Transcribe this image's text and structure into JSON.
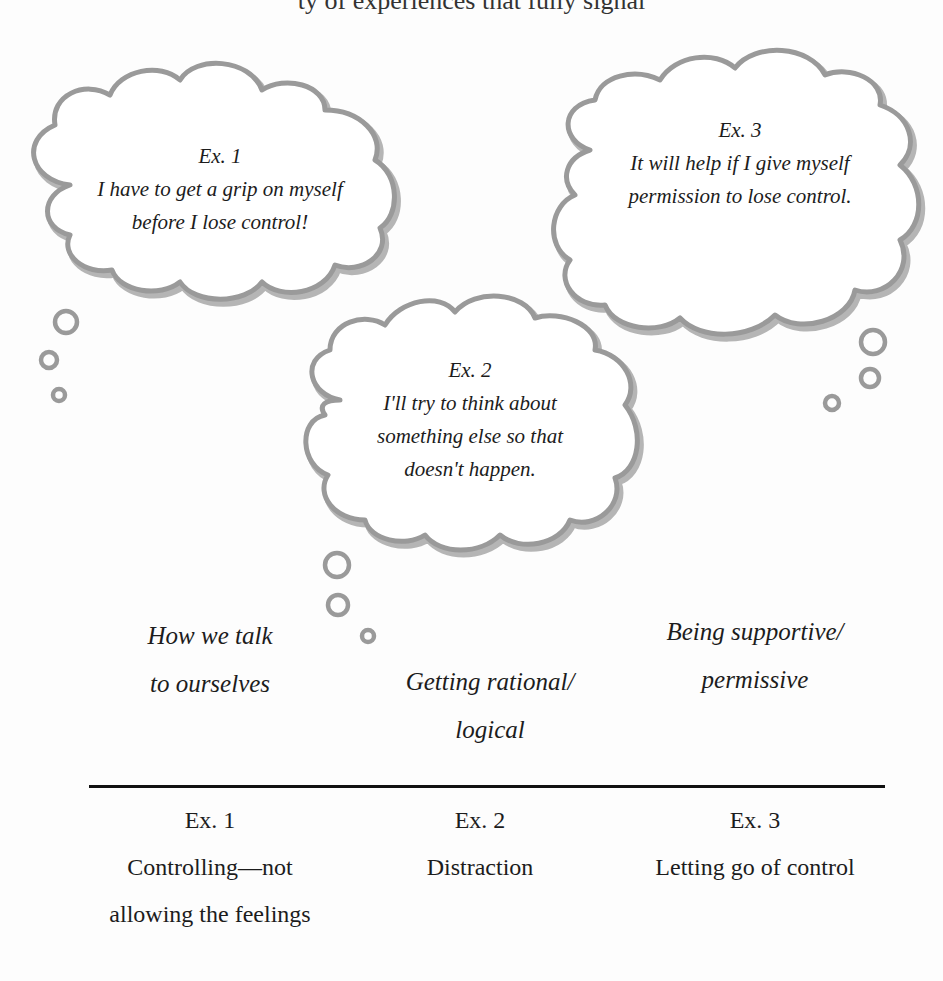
{
  "top_clipped_text": "ty of experiences that fully signal",
  "clouds": [
    {
      "id": "ex1",
      "label": "Ex. 1",
      "lines": [
        "I have to get a grip on myself",
        "before I lose control!"
      ]
    },
    {
      "id": "ex2",
      "label": "Ex. 2",
      "lines": [
        "I'll try to think about",
        "something else so that",
        "doesn't happen."
      ]
    },
    {
      "id": "ex3",
      "label": "Ex. 3",
      "lines": [
        "It will help if I give myself",
        "permission to lose control."
      ]
    }
  ],
  "categories": {
    "left": [
      "How we talk",
      "to ourselves"
    ],
    "middle": [
      "Getting rational/",
      "logical"
    ],
    "right": [
      "Being supportive/",
      "permissive"
    ]
  },
  "examples": [
    {
      "label": "Ex. 1",
      "lines": [
        "Controlling—not",
        "allowing the feelings"
      ]
    },
    {
      "label": "Ex. 2",
      "lines": [
        "Distraction"
      ]
    },
    {
      "label": "Ex. 3",
      "lines": [
        "Letting go of control"
      ]
    }
  ],
  "colors": {
    "cloud_stroke": "#9a9a9a",
    "text": "#1c1c1c",
    "divider": "#111111",
    "background": "#fdfdfd"
  }
}
